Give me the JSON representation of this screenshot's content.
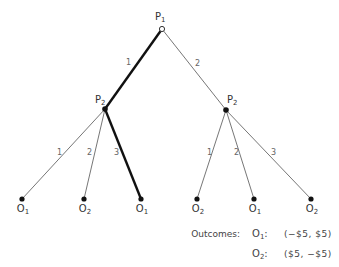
{
  "diagram": {
    "type": "extensive-form game tree",
    "root": {
      "player": "P",
      "player_sub": "1"
    },
    "branches_root": [
      {
        "label": "1",
        "chosen": true
      },
      {
        "label": "2",
        "chosen": false
      }
    ],
    "left_node": {
      "player": "P",
      "player_sub": "2"
    },
    "right_node": {
      "player": "P",
      "player_sub": "2"
    },
    "left_branches": [
      {
        "label": "1",
        "chosen": false
      },
      {
        "label": "2",
        "chosen": false
      },
      {
        "label": "3",
        "chosen": true
      }
    ],
    "right_branches": [
      {
        "label": "1",
        "chosen": false
      },
      {
        "label": "2",
        "chosen": false
      },
      {
        "label": "3",
        "chosen": false
      }
    ],
    "leaves": [
      {
        "o": "O",
        "sub": "1"
      },
      {
        "o": "O",
        "sub": "2"
      },
      {
        "o": "O",
        "sub": "1"
      },
      {
        "o": "O",
        "sub": "2"
      },
      {
        "o": "O",
        "sub": "1"
      },
      {
        "o": "O",
        "sub": "2"
      }
    ]
  },
  "outcomes": {
    "heading": "Outcomes:",
    "rows": [
      {
        "o": "O",
        "sub": "1",
        "sep": ":",
        "value": "(−$5, $5)"
      },
      {
        "o": "O",
        "sub": "2",
        "sep": ":",
        "value": "($5, −$5)"
      }
    ]
  },
  "colors": {
    "line": "#555555",
    "chosen_line": "#111111",
    "node": "#111111"
  }
}
